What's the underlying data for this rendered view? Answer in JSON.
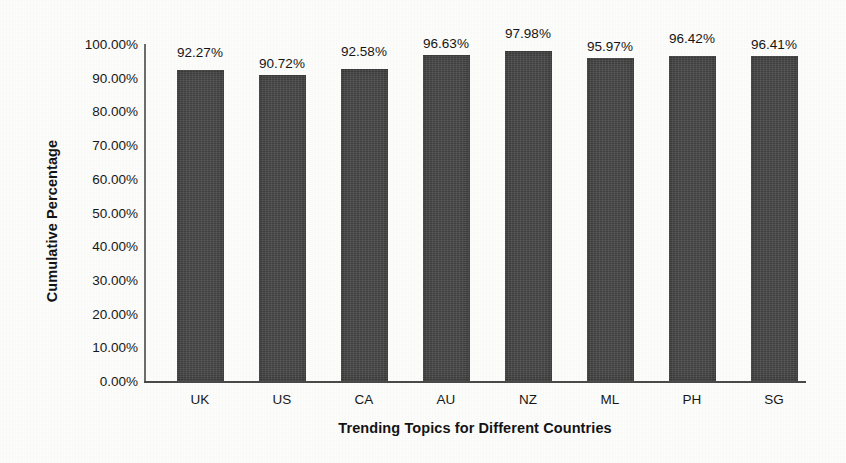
{
  "chart_data": {
    "type": "bar",
    "title": "",
    "xlabel": "Trending Topics for Different Countries",
    "ylabel": "Cumulative Percentage",
    "categories": [
      "UK",
      "US",
      "CA",
      "AU",
      "NZ",
      "ML",
      "PH",
      "SG"
    ],
    "values": [
      92.27,
      90.72,
      92.58,
      96.63,
      97.98,
      95.97,
      96.42,
      96.41
    ],
    "value_labels": [
      "92.27%",
      "90.72%",
      "92.58%",
      "96.63%",
      "97.98%",
      "95.97%",
      "96.42%",
      "96.41%"
    ],
    "ylim": [
      0,
      100
    ],
    "ytick_values": [
      100,
      90,
      80,
      70,
      60,
      50,
      40,
      30,
      20,
      10,
      0
    ],
    "ytick_labels": [
      "100.00%",
      "90.00%",
      "80.00%",
      "70.00%",
      "60.00%",
      "50.00%",
      "40.00%",
      "30.00%",
      "20.00%",
      "10.00%",
      "0.00%"
    ],
    "grid": false,
    "legend": false,
    "series": [
      {
        "name": "Cumulative Percentage",
        "values": [
          92.27,
          90.72,
          92.58,
          96.63,
          97.98,
          95.97,
          96.42,
          96.41
        ]
      }
    ],
    "bar_color": "#474747",
    "background_color": "#fdfdfc",
    "text_color": "#181818"
  }
}
